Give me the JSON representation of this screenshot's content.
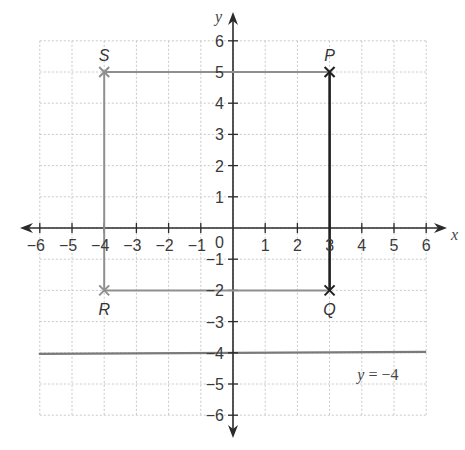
{
  "figure": {
    "colors": {
      "background": "#ffffff",
      "grid": "#c8c8c8",
      "axis": "#2b2b2b",
      "shape_edge": "#8f8f8f",
      "highlight_edge": "#1f1f1f",
      "line": "#7a7a7a",
      "text": "#3a3a3a"
    },
    "axes": {
      "x_label": "x",
      "y_label": "y",
      "origin_label": "0",
      "x_min": -6,
      "x_max": 6,
      "y_min": -6,
      "y_max": 6,
      "x_ticks": [
        -6,
        -5,
        -4,
        -3,
        -2,
        -1,
        1,
        2,
        3,
        4,
        5,
        6
      ],
      "y_ticks": [
        -6,
        -5,
        -4,
        -3,
        -2,
        -1,
        1,
        2,
        3,
        4,
        5,
        6
      ],
      "x_tick_labels": [
        "−6",
        "−5",
        "−4",
        "−3",
        "−2",
        "−1",
        "1",
        "2",
        "3",
        "4",
        "5",
        "6"
      ],
      "y_tick_labels": [
        "−6",
        "−5",
        "−4",
        "−3",
        "−2",
        "−1",
        "1",
        "2",
        "3",
        "4",
        "5",
        "6"
      ]
    },
    "points": [
      {
        "label": "S",
        "x": -4,
        "y": 5,
        "marker": "cross",
        "style": "light",
        "label_pos": "above"
      },
      {
        "label": "P",
        "x": 3,
        "y": 5,
        "marker": "cross",
        "style": "dark",
        "label_pos": "above"
      },
      {
        "label": "Q",
        "x": 3,
        "y": -2,
        "marker": "cross",
        "style": "dark",
        "label_pos": "below"
      },
      {
        "label": "R",
        "x": -4,
        "y": -2,
        "marker": "cross",
        "style": "light",
        "label_pos": "below"
      }
    ],
    "segments": [
      {
        "from": "S",
        "to": "P",
        "style": "light"
      },
      {
        "from": "S",
        "to": "R",
        "style": "light"
      },
      {
        "from": "R",
        "to": "Q",
        "style": "light"
      },
      {
        "from": "P",
        "to": "Q",
        "style": "dark"
      }
    ],
    "lines": [
      {
        "equation": "y = −4",
        "equation_var": "y",
        "equation_rest": " = −4",
        "y": -4,
        "x_from": -6,
        "x_to": 6,
        "label_x": 4.5,
        "label_y": -4.7
      }
    ]
  }
}
